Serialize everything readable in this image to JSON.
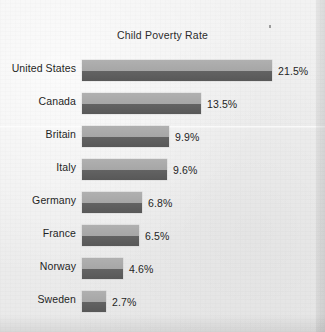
{
  "chart_data": {
    "type": "bar",
    "orientation": "horizontal",
    "title": "Child Poverty Rate",
    "xlabel": "",
    "ylabel": "",
    "grid": false,
    "legend": false,
    "value_suffix": "%",
    "xlim": [
      0,
      21.5
    ],
    "categories": [
      "United States",
      "Canada",
      "Britain",
      "Italy",
      "Germany",
      "France",
      "Norway",
      "Sweden"
    ],
    "values": [
      21.5,
      13.5,
      9.9,
      9.6,
      6.8,
      6.5,
      4.6,
      2.7
    ],
    "value_labels": [
      "21.5%",
      "13.5%",
      "9.9%",
      "9.6%",
      "6.8%",
      "6.5%",
      "4.6%",
      "2.7%"
    ],
    "bars": [
      {
        "category": "United States",
        "value": 21.5,
        "value_label": "21.5%"
      },
      {
        "category": "Canada",
        "value": 13.5,
        "value_label": "13.5%"
      },
      {
        "category": "Britain",
        "value": 9.9,
        "value_label": "9.9%"
      },
      {
        "category": "Italy",
        "value": 9.6,
        "value_label": "9.6%"
      },
      {
        "category": "Germany",
        "value": 6.8,
        "value_label": "6.8%"
      },
      {
        "category": "France",
        "value": 6.5,
        "value_label": "6.5%"
      },
      {
        "category": "Norway",
        "value": 4.6,
        "value_label": "4.6%"
      },
      {
        "category": "Sweden",
        "value": 2.7,
        "value_label": "2.7%"
      }
    ],
    "colors": {
      "bar_light": "#aaaaaa",
      "bar_dark": "#5e5e5e",
      "background": "#eeeeee",
      "text": "#1f1f1f"
    }
  }
}
